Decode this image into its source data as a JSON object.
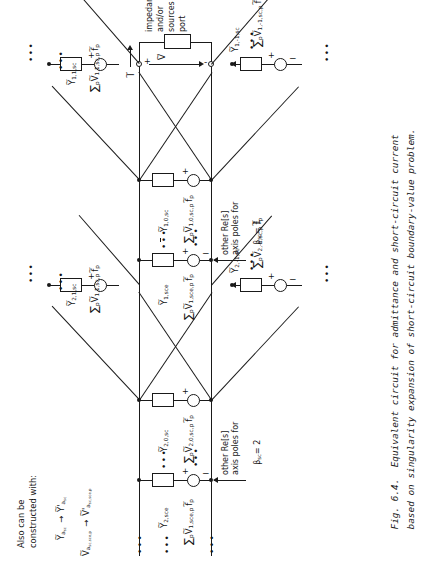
{
  "figure": {
    "number": "Fig. 6.4.",
    "caption_line1": "Equivalent circuit for admittance and short-circuit current",
    "caption_line2": "based on singularity expansion of short-circuit boundary-value problem.",
    "orientation": "rotated-90-ccw",
    "ink_color": "#1a1a1a",
    "paper_color": "#ffffff"
  },
  "port": {
    "annotation_line1": "impedances",
    "annotation_line2": "and/or",
    "annotation_line3": "sources at",
    "annotation_line4": "port",
    "current_label": "I",
    "voltage_label": "V",
    "plus": "+",
    "minus": "-"
  },
  "branches": {
    "sec1": {
      "left_outer": {
        "admittance": "Y",
        "admittance_sub": "1,1,sc",
        "source": "V",
        "source_sub": "1,1,sc,p",
        "sum": "p",
        "force": "f",
        "force_sub": "p"
      },
      "right_outer": {
        "admittance": "Y",
        "admittance_sub": "1,-1,sc",
        "source": "V",
        "source_sub": "1,-1,sc,p",
        "sum": "p",
        "force": "f",
        "force_sub": "p"
      },
      "center": {
        "admittance": "Y",
        "admittance_sub": "1,0,sc",
        "source": "V",
        "source_sub": "1,0,sc,p",
        "sum": "p",
        "force": "f",
        "force_sub": "p"
      },
      "entire": {
        "admittance": "Y",
        "admittance_sub": "1,sce",
        "source": "V",
        "source_sub": "1,sce,p",
        "sum": "p",
        "force": "f",
        "force_sub": "p"
      },
      "poles_note_l1": "other Re[s]",
      "poles_note_l2": "axis poles for",
      "poles_note_l3": "β",
      "poles_note_sub": "sc",
      "poles_note_val": "= 1"
    },
    "sec2": {
      "left_outer": {
        "admittance": "Y",
        "admittance_sub": "2,1,sc",
        "source": "V",
        "source_sub": "1,1,sc,p",
        "sum": "p",
        "force": "f",
        "force_sub": "p"
      },
      "right_outer": {
        "admittance": "Y",
        "admittance_sub": "2,-1,sc",
        "source": "V",
        "source_sub": "2,-1,sc,p",
        "sum": "p",
        "force": "f",
        "force_sub": "p"
      },
      "center": {
        "admittance": "Y",
        "admittance_sub": "2,0,sc",
        "source": "V",
        "source_sub": "2,0,sc,p",
        "sum": "p",
        "force": "f",
        "force_sub": "p"
      },
      "entire": {
        "admittance": "Y",
        "admittance_sub": "2,sce",
        "source": "V",
        "source_sub": "1,sce,p",
        "sum": "p",
        "force": "f",
        "force_sub": "p"
      },
      "poles_note_l1": "other Re[s]",
      "poles_note_l2": "axis poles for",
      "poles_note_l3": "β",
      "poles_note_sub": "sc",
      "poles_note_val": "= 2"
    }
  },
  "alt_note": {
    "line1": "Also can be",
    "line2": "constructed with:",
    "sub1_from": "Y",
    "sub1_from_sub": "a",
    "sub1_from_sub2": "sc",
    "sub1_to": "Y",
    "sub1_to_prime": "'",
    "sub1_to_sub": "a",
    "sub1_to_sub2": "sc",
    "sub2_from": "V",
    "sub2_from_sub": "a",
    "sub2_from_sub2": "sc,sce,p",
    "sub2_to": "V",
    "sub2_to_prime": "'",
    "sub2_to_sub": "a",
    "sub2_to_sub2": "sc,sce,p",
    "arrow": "→"
  },
  "glyphs": {
    "ellipsis": "•••",
    "sigma": "∑",
    "tilde": "∼",
    "plus": "+",
    "minus": "−"
  }
}
